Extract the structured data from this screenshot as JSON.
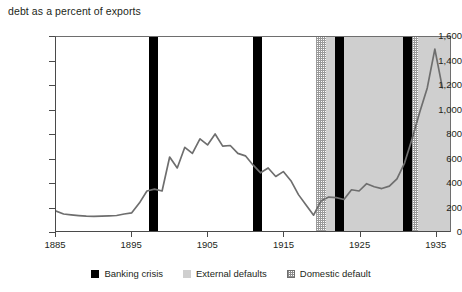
{
  "chart_data": {
    "type": "line",
    "title": "debt as a percent of exports",
    "xlabel": "",
    "ylabel": "",
    "xlim": [
      1885,
      1937
    ],
    "ylim": [
      0,
      1600
    ],
    "grid": false,
    "y_ticks": [
      "0",
      "200",
      "400",
      "600",
      "800",
      "1,000",
      "1,200",
      "1,400",
      "1,600"
    ],
    "y_tick_values": [
      0,
      200,
      400,
      600,
      800,
      1000,
      1200,
      1400,
      1600
    ],
    "x_ticks": [
      "1885",
      "1895",
      "1905",
      "1915",
      "1925",
      "1935"
    ],
    "x_tick_values": [
      1885,
      1895,
      1905,
      1915,
      1925,
      1935
    ],
    "series": [
      {
        "name": "debt as a percent of exports",
        "color": "#6e6e6e",
        "x": [
          1885,
          1886,
          1887,
          1888,
          1889,
          1890,
          1891,
          1892,
          1893,
          1894,
          1895,
          1896,
          1897,
          1898,
          1899,
          1900,
          1901,
          1902,
          1903,
          1904,
          1905,
          1906,
          1907,
          1908,
          1909,
          1910,
          1911,
          1912,
          1913,
          1914,
          1915,
          1916,
          1917,
          1918,
          1919,
          1920,
          1921,
          1922,
          1923,
          1924,
          1925,
          1926,
          1927,
          1928,
          1929,
          1930,
          1931,
          1932,
          1933,
          1934,
          1935,
          1936
        ],
        "values": [
          165,
          140,
          133,
          127,
          122,
          120,
          122,
          125,
          128,
          140,
          150,
          230,
          330,
          345,
          330,
          610,
          520,
          690,
          640,
          760,
          710,
          800,
          700,
          705,
          640,
          620,
          545,
          480,
          520,
          450,
          490,
          415,
          300,
          215,
          130,
          250,
          280,
          275,
          260,
          340,
          330,
          390,
          365,
          350,
          370,
          430,
          560,
          760,
          980,
          1180,
          1500,
          1180
        ]
      }
    ],
    "bands": {
      "external_defaults": [
        {
          "start": 1920.1,
          "end": 1937.0
        }
      ],
      "banking_crises": [
        {
          "start": 1897.2,
          "end": 1898.4
        },
        {
          "start": 1910.9,
          "end": 1912.1
        },
        {
          "start": 1921.6,
          "end": 1922.8
        },
        {
          "start": 1930.6,
          "end": 1931.7
        }
      ],
      "domestic_defaults": [
        {
          "start": 1919.2,
          "end": 1920.4
        },
        {
          "start": 1931.5,
          "end": 1932.6
        }
      ]
    },
    "legend": {
      "position": "bottom",
      "items": [
        {
          "label": "Banking crisis",
          "swatch": "black-square",
          "color": "#000000"
        },
        {
          "label": "External defaults",
          "swatch": "gray-square",
          "color": "#cfcfcf"
        },
        {
          "label": "Domestic default",
          "swatch": "hatched-square",
          "color": "#ffffff"
        }
      ]
    }
  }
}
